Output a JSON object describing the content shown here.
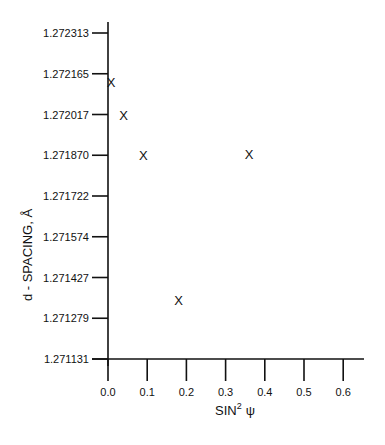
{
  "chart_data": {
    "type": "scatter",
    "title": "",
    "xlabel": "SIN",
    "xlabel_sup": "2",
    "xlabel_tail": "ψ",
    "ylabel": "d - SPACING, Å",
    "xlim": [
      0.0,
      0.65
    ],
    "ylim": [
      1.271131,
      1.272313
    ],
    "x_ticks": [
      "0.0",
      "0.1",
      "0.2",
      "0.3",
      "0.4",
      "0.5",
      "0.6"
    ],
    "y_ticks": [
      "1.272313",
      "1.272165",
      "1.272017",
      "1.271870",
      "1.271722",
      "1.271574",
      "1.271427",
      "1.271279",
      "1.271131"
    ],
    "marker": "X",
    "grid": false,
    "series": [
      {
        "name": "d-spacing",
        "points": [
          {
            "x": 0.0,
            "y": 1.272136
          },
          {
            "x": 0.04,
            "y": 1.272017
          },
          {
            "x": 0.09,
            "y": 1.27187
          },
          {
            "x": 0.36,
            "y": 1.271874
          },
          {
            "x": 0.18,
            "y": 1.271345
          }
        ]
      }
    ]
  }
}
